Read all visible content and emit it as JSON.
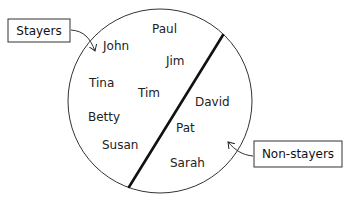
{
  "diagram": {
    "type": "set-partition",
    "circle": {
      "cx": 160,
      "cy": 101,
      "r": 92
    },
    "divider": {
      "x1": 223,
      "y1": 35,
      "x2": 129,
      "y2": 187
    },
    "groups": {
      "stayers": {
        "label": "Stayers",
        "members": [
          "Paul",
          "John",
          "Jim",
          "Tina",
          "Tim",
          "Betty",
          "Susan"
        ]
      },
      "non_stayers": {
        "label": "Non-stayers",
        "members": [
          "David",
          "Pat",
          "Sarah"
        ]
      }
    },
    "names": {
      "paul": "Paul",
      "john": "John",
      "jim": "Jim",
      "tina": "Tina",
      "tim": "Tim",
      "betty": "Betty",
      "susan": "Susan",
      "david": "David",
      "pat": "Pat",
      "sarah": "Sarah"
    },
    "colors": {
      "stroke": "#222222",
      "divider": "#111111",
      "background": "#ffffff"
    }
  }
}
